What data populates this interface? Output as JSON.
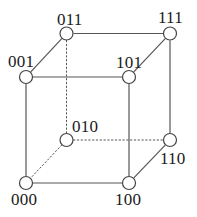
{
  "figure": {
    "name": "binary-cube-diagram",
    "width": 197,
    "height": 217,
    "background_color": "#ffffff",
    "line_color": "#555555",
    "node_fill": "#ffffff",
    "node_stroke": "#444444",
    "label_color": "#1a1a1a"
  },
  "nodes": [
    {
      "id": "011",
      "label": "011",
      "cx": 66.5,
      "cy": 33.5,
      "r": 6.5,
      "label_x": 57,
      "label_y": 11
    },
    {
      "id": "111",
      "label": "111",
      "cx": 170,
      "cy": 33.5,
      "r": 6.5,
      "label_x": 158,
      "label_y": 9
    },
    {
      "id": "001",
      "label": "001",
      "cx": 26,
      "cy": 77,
      "r": 6.5,
      "label_x": 8,
      "label_y": 53
    },
    {
      "id": "101",
      "label": "101",
      "cx": 129,
      "cy": 77,
      "r": 6.5,
      "label_x": 116,
      "label_y": 54
    },
    {
      "id": "010",
      "label": "010",
      "cx": 66.5,
      "cy": 140,
      "r": 6.5,
      "label_x": 72,
      "label_y": 118
    },
    {
      "id": "110",
      "label": "110",
      "cx": 170,
      "cy": 140,
      "r": 6.5,
      "label_x": 160,
      "label_y": 150
    },
    {
      "id": "000",
      "label": "000",
      "cx": 26,
      "cy": 183,
      "r": 6.5,
      "label_x": 11,
      "label_y": 191
    },
    {
      "id": "100",
      "label": "100",
      "cx": 129,
      "cy": 183,
      "r": 6.5,
      "label_x": 115,
      "label_y": 191
    }
  ],
  "edges": [
    {
      "id": "011-111",
      "from": "011",
      "to": "111",
      "style": "solid"
    },
    {
      "id": "011-001",
      "from": "011",
      "to": "001",
      "style": "solid"
    },
    {
      "id": "001-101",
      "from": "001",
      "to": "101",
      "style": "solid"
    },
    {
      "id": "101-111",
      "from": "101",
      "to": "111",
      "style": "solid"
    },
    {
      "id": "001-000",
      "from": "001",
      "to": "000",
      "style": "solid"
    },
    {
      "id": "101-100",
      "from": "101",
      "to": "100",
      "style": "solid"
    },
    {
      "id": "111-110",
      "from": "111",
      "to": "110",
      "style": "solid"
    },
    {
      "id": "000-100",
      "from": "000",
      "to": "100",
      "style": "solid"
    },
    {
      "id": "100-110",
      "from": "100",
      "to": "110",
      "style": "solid"
    },
    {
      "id": "011-010",
      "from": "011",
      "to": "010",
      "style": "dotted"
    },
    {
      "id": "010-000",
      "from": "010",
      "to": "000",
      "style": "dotted"
    },
    {
      "id": "010-110",
      "from": "010",
      "to": "110",
      "style": "dotted"
    }
  ]
}
